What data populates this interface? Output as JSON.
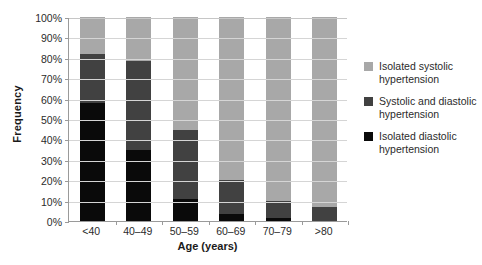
{
  "chart_data": {
    "type": "bar",
    "subtype": "stacked-100-percent",
    "title": "",
    "xlabel": "Age (years)",
    "ylabel": "Frequency",
    "categories": [
      "<40",
      "40–49",
      "50–59",
      "60–69",
      "70–79",
      ">80"
    ],
    "ylim": [
      0,
      100
    ],
    "ytick_labels": [
      "100%",
      "90%",
      "80%",
      "70%",
      "60%",
      "50%",
      "40%",
      "30%",
      "20%",
      "10%",
      "0%"
    ],
    "ytick_values": [
      100,
      90,
      80,
      70,
      60,
      50,
      40,
      30,
      20,
      10,
      0
    ],
    "grid": true,
    "grid_axis": "y",
    "legend_position": "right",
    "series": [
      {
        "name": "Isolated diastolic hypertension",
        "color": "#0a0a0a",
        "values": [
          58,
          35,
          11,
          3.5,
          1.5,
          0
        ]
      },
      {
        "name": "Systolic and diastolic hypertension",
        "color": "#414141",
        "values": [
          24,
          43.5,
          33.5,
          16.5,
          8.5,
          7
        ]
      },
      {
        "name": "Isolated systolic hypertension",
        "color": "#a8a8a8",
        "values": [
          18,
          21.5,
          55.5,
          80,
          90,
          93
        ]
      }
    ],
    "stack_order_bottom_to_top": [
      "Isolated diastolic hypertension",
      "Systolic and diastolic hypertension",
      "Isolated systolic hypertension"
    ]
  },
  "legend": {
    "entries": [
      {
        "label": "Isolated systolic hypertension",
        "color": "#a8a8a8"
      },
      {
        "label": "Systolic and diastolic hypertension",
        "color": "#414141"
      },
      {
        "label": "Isolated diastolic hypertension",
        "color": "#0a0a0a"
      }
    ]
  },
  "axes": {
    "x_title": "Age (years)",
    "y_title": "Frequency"
  },
  "colors": {
    "axis": "#9a9a9a",
    "grid": "#d5d5d5",
    "text": "#2b2b2b",
    "background": "#ffffff"
  }
}
